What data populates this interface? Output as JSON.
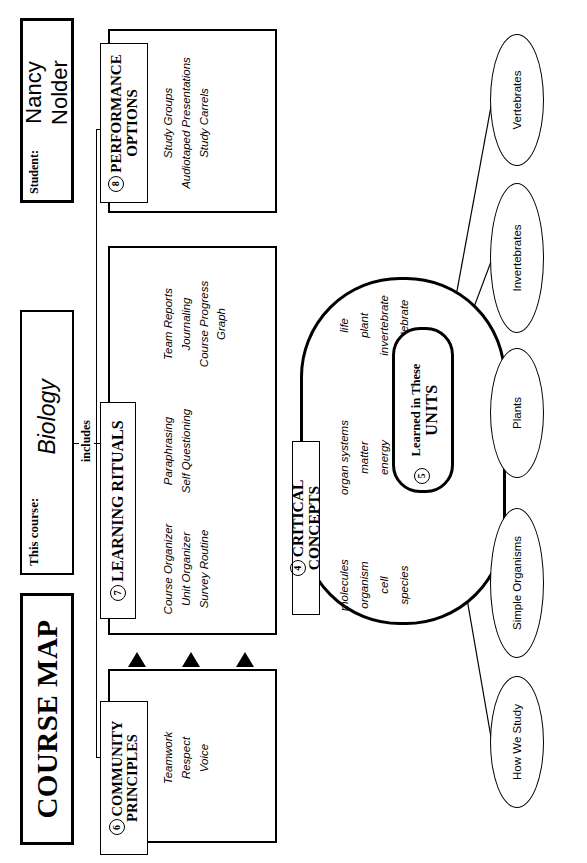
{
  "header": {
    "title": "COURSE MAP",
    "course_label": "This course:",
    "course_value": "Biology",
    "student_label": "Student:",
    "student_value": "Nancy Nolder",
    "includes_label": "includes"
  },
  "panels": [
    {
      "number": "6",
      "title_line1": "COMMUNITY",
      "title_line2": "PRINCIPLES",
      "columns": [
        {
          "items": [
            "Teamwork",
            "Respect",
            "Voice"
          ]
        }
      ]
    },
    {
      "number": "7",
      "title_line1": "LEARNING RITUALS",
      "title_line2": "",
      "columns": [
        {
          "items": [
            "Course Organizer",
            "Unit Organizer",
            "Survey Routine"
          ]
        },
        {
          "items": [
            "Paraphrasing",
            "Self Questioning"
          ]
        },
        {
          "items": [
            "Team Reports",
            "Journaling",
            "Course Progress",
            "Graph"
          ]
        }
      ]
    },
    {
      "number": "8",
      "title_line1": "PERFORMANCE",
      "title_line2": "OPTIONS",
      "columns": [
        {
          "items": [
            "Study Groups",
            "Audiotaped Presentations",
            "Study Carrels"
          ]
        }
      ]
    }
  ],
  "critical_concepts": {
    "number": "4",
    "title": "CRITICAL CONCEPTS",
    "columns": [
      [
        "molecules",
        "organism",
        "cell",
        "species"
      ],
      [
        "organ systems",
        "matter",
        "energy",
        "organic"
      ],
      [
        "life",
        "plant",
        "invertebrate",
        "vertebrate"
      ]
    ]
  },
  "units_node": {
    "number": "5",
    "line1": "Learned in These",
    "line2": "UNITS"
  },
  "units": [
    {
      "label": "How We Study"
    },
    {
      "label": "Simple Organisms"
    },
    {
      "label": "Plants"
    },
    {
      "label": "Invertebrates"
    },
    {
      "label": "Vertebrates"
    }
  ]
}
